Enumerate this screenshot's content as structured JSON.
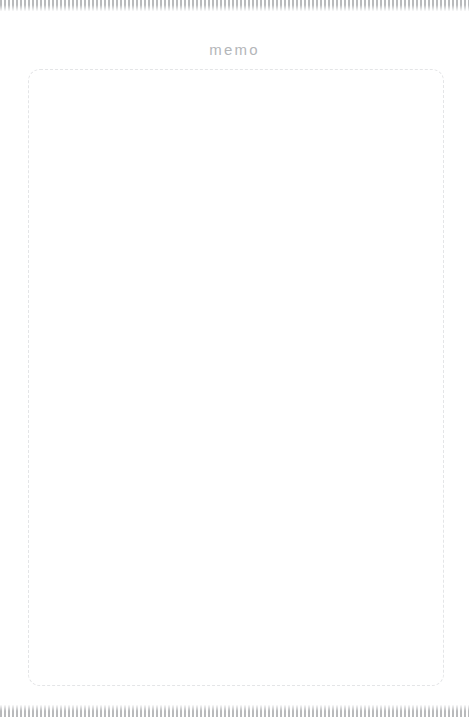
{
  "page": {
    "title": "memo",
    "background_color": "#ffffff"
  },
  "decor": {
    "top_rule": {
      "name": "striped-rule",
      "stripe_color": "#b9babc",
      "gap_color": "#ffffff"
    },
    "bottom_rule": {
      "name": "striped-rule",
      "stripe_color": "#b9babc",
      "gap_color": "#ffffff"
    }
  },
  "heading": {
    "text": "memo",
    "color": "#b4b6b9"
  },
  "memo": {
    "value": "",
    "placeholder": "",
    "border_color": "#e4e5e7",
    "border_style": "dashed"
  }
}
